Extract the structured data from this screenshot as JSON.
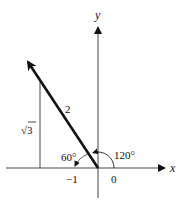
{
  "diagram": {
    "axes": {
      "x_label": "x",
      "y_label": "y",
      "tick_labels": [
        "−1",
        "0"
      ]
    },
    "vector": {
      "length_label": "2",
      "direction_angle_label": "120°"
    },
    "reference_angle_label": "60°",
    "vertical_side_label": "√3",
    "radicand": "3"
  }
}
